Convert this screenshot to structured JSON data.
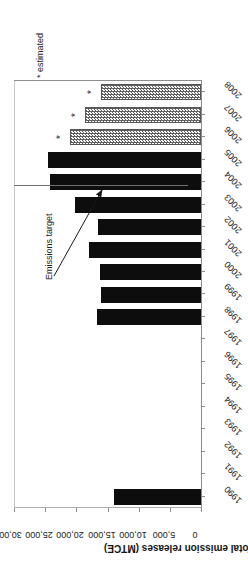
{
  "chart_data": {
    "type": "bar",
    "orientation": "horizontal-rotated",
    "title": "",
    "xlabel": "",
    "ylabel": "Total emission releases (MTCE)",
    "ylim": [
      0,
      30000
    ],
    "yticks": [
      0,
      5000,
      10000,
      15000,
      20000,
      25000,
      30000
    ],
    "ytick_labels": [
      "0",
      "5,000",
      "10,000",
      "15,000",
      "20,000",
      "25,000",
      "30,000"
    ],
    "grid": false,
    "legend_position": "none",
    "categories": [
      "1990",
      "1991",
      "1992",
      "1993",
      "1994",
      "1995",
      "1996",
      "1997",
      "1998",
      "1999",
      "2000",
      "2001",
      "2002",
      "2003",
      "2004",
      "2005",
      "2006",
      "2007",
      "2008"
    ],
    "values": [
      13950,
      null,
      null,
      null,
      null,
      null,
      null,
      null,
      16700,
      16050,
      16200,
      18000,
      16500,
      20200,
      24200,
      24550,
      21000,
      18600,
      16050
    ],
    "series": [
      {
        "name": "Total emission releases (MTCE)",
        "categories": [
          "1990",
          "1991",
          "1992",
          "1993",
          "1994",
          "1995",
          "1996",
          "1997",
          "1998",
          "1999",
          "2000",
          "2001",
          "2002",
          "2003",
          "2004",
          "2005",
          "2006",
          "2007",
          "2008"
        ],
        "values": [
          13950,
          null,
          null,
          null,
          null,
          null,
          null,
          null,
          16700,
          16050,
          16200,
          18000,
          16500,
          20200,
          24200,
          24550,
          21000,
          18600,
          16050
        ],
        "estimated_flags": [
          false,
          false,
          false,
          false,
          false,
          false,
          false,
          false,
          false,
          false,
          false,
          false,
          false,
          false,
          false,
          false,
          true,
          true,
          true
        ]
      }
    ],
    "reference_lines": [
      {
        "label": "Emissions target",
        "value": 13800,
        "orientation": "vertical"
      }
    ],
    "annotations": [
      {
        "name": "target-callout",
        "text": "Emissions target"
      },
      {
        "name": "estimated-note",
        "text": "* estimated"
      }
    ],
    "marks": [
      {
        "name": "estimated-star",
        "text": "*"
      }
    ]
  },
  "axis": {
    "value_title": "Total emission releases (MTCE)",
    "tick_labels": [
      "30,000",
      "25,000",
      "20,000",
      "15,000",
      "10,000",
      "5,000",
      "0"
    ],
    "year_labels": [
      "1990",
      "1991",
      "1992",
      "1993",
      "1994",
      "1995",
      "1996",
      "1997",
      "1998",
      "1999",
      "2000",
      "2001",
      "2002",
      "2003",
      "2004",
      "2005",
      "2006",
      "2007",
      "2008"
    ]
  },
  "notes": {
    "estimated": "* estimated",
    "target": "Emissions target",
    "star": "*"
  },
  "colors": {
    "bar_solid": "#0d0d0d",
    "bar_hatched_line": "#5e5e5e",
    "bar_hatched_fill": "#fbfbfb",
    "axis": "#8d8d8d",
    "target_line": "#6f6f6f",
    "text": "#1b1b1b",
    "background": "#ffffff"
  }
}
